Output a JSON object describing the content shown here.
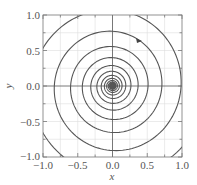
{
  "chart_data": {
    "type": "line",
    "title": "",
    "xlabel": "x",
    "ylabel": "y",
    "xlim": [
      -1.0,
      1.0
    ],
    "ylim": [
      -1.0,
      1.0
    ],
    "grid": true,
    "xticks": [
      "−1.0",
      "−0.5",
      "0.0",
      "0.5",
      "1.0"
    ],
    "yticks": [
      "1.0",
      "0.5",
      "0.0",
      "−0.5",
      "−1.0"
    ],
    "series": [
      {
        "name": "spiral trajectory (converging to origin)",
        "description": "logarithmic spiral, clockwise inward",
        "approx_radii_crossings": [
          1.3,
          0.95,
          0.7,
          0.5,
          0.36,
          0.26,
          0.19,
          0.14,
          0.1,
          0.07,
          0.05,
          0.035,
          0.025
        ]
      }
    ],
    "annotations": [
      {
        "type": "arrow",
        "x": 0.4,
        "y": 0.7,
        "direction": "clockwise"
      }
    ],
    "colors": {
      "curve": "#555555",
      "grid": "#d8d8d8",
      "axis": "#555555"
    }
  },
  "axes": {
    "xlabel": "x",
    "ylabel": "y",
    "xticks": [
      "−1.0",
      "−0.5",
      "0.0",
      "0.5",
      "1.0"
    ],
    "yticks": [
      "1.0",
      "0.5",
      "0.0",
      "−0.5",
      "−1.0"
    ]
  }
}
